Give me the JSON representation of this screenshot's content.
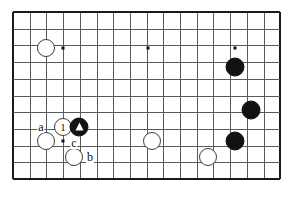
{
  "figure": {
    "kind": "go-board-diagram",
    "width": 290,
    "height": 203,
    "background_color": "#ffffff"
  },
  "board": {
    "origin_x": 13,
    "origin_y": 12,
    "cell_size": 16.7,
    "columns": 17,
    "rows": 11,
    "line_color": "#5a5a5a",
    "edge_color": "#1a1a1a",
    "edges": {
      "left": true,
      "right": true,
      "top": true,
      "bottom": true
    }
  },
  "star_points": [
    {
      "name": "star-point-left",
      "x": 63,
      "y": 48
    },
    {
      "name": "star-point-center",
      "x": 148,
      "y": 48
    },
    {
      "name": "star-point-right",
      "x": 235,
      "y": 48
    },
    {
      "name": "star-point-lower-left",
      "x": 63,
      "y": 141
    }
  ],
  "stones": [
    {
      "name": "white-stone-upper-left",
      "color": "white",
      "x": 46,
      "y": 48,
      "radius": 9,
      "mark": null
    },
    {
      "name": "black-stone-right-upper",
      "color": "black",
      "x": 235,
      "y": 67,
      "radius": 9.5,
      "mark": null
    },
    {
      "name": "black-stone-right-middle",
      "color": "black",
      "x": 251,
      "y": 110,
      "radius": 9.5,
      "mark": null
    },
    {
      "name": "black-stone-right-lower",
      "color": "black",
      "x": 235,
      "y": 141,
      "radius": 9.5,
      "mark": null
    },
    {
      "name": "white-stone-marked-one",
      "color": "white",
      "x": 63,
      "y": 127,
      "radius": 9,
      "mark": "number",
      "mark_text": "1"
    },
    {
      "name": "black-stone-marked-triangle",
      "color": "black",
      "x": 79,
      "y": 127,
      "radius": 9.5,
      "mark": "triangle",
      "mark_text": ""
    },
    {
      "name": "white-stone-left-lower",
      "color": "white",
      "x": 46,
      "y": 141,
      "radius": 9,
      "mark": null
    },
    {
      "name": "white-stone-center-lower",
      "color": "white",
      "x": 152,
      "y": 141,
      "radius": 9,
      "mark": null
    },
    {
      "name": "white-stone-bottom-left",
      "color": "white",
      "x": 74,
      "y": 157,
      "radius": 9,
      "mark": null
    },
    {
      "name": "white-stone-bottom-right",
      "color": "white",
      "x": 208,
      "y": 157,
      "radius": 9,
      "mark": null
    }
  ],
  "labels": [
    {
      "name": "point-label-a",
      "text": "a",
      "x": 41,
      "y": 127
    },
    {
      "name": "point-label-c",
      "text": "c",
      "x": 74,
      "y": 143
    },
    {
      "name": "point-label-b",
      "text": "b",
      "x": 90,
      "y": 157
    }
  ]
}
